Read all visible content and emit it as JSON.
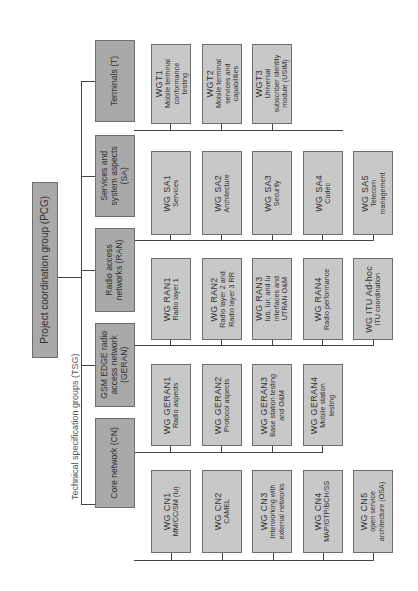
{
  "diagram": {
    "orientation": "rotated 90 degrees counter-clockwise",
    "root": {
      "label": "Project coordination group (PCG)"
    },
    "tsg_caption": "Technical specification groups (TSG)",
    "colors": {
      "root_fill": "#a9a9a9",
      "tsg_fill": "#a9a9a9",
      "wg_fill": "#c8c8c8",
      "line": "#444444",
      "border": "#6e6e6e"
    },
    "tsgs": [
      {
        "label": "Terminals (T)",
        "wgs": [
          {
            "title": "WGT1",
            "desc": [
              "Mobile terminal",
              "conformance",
              "testing"
            ]
          },
          {
            "title": "WGT2",
            "desc": [
              "Mobile terminal",
              "services and",
              "capabilities"
            ]
          },
          {
            "title": "WGT3",
            "desc": [
              "Universal",
              "subscriber identity",
              "module (USIM)"
            ]
          }
        ]
      },
      {
        "label": "Services and system aspects (SA)",
        "label_lines": [
          "Services and",
          "system aspects",
          "(SA)"
        ],
        "wgs": [
          {
            "title": "WG SA1",
            "desc": [
              "Services"
            ]
          },
          {
            "title": "WG SA2",
            "desc": [
              "Architecture"
            ]
          },
          {
            "title": "WG SA3",
            "desc": [
              "Security"
            ]
          },
          {
            "title": "WG SA4",
            "desc": [
              "Codec"
            ]
          },
          {
            "title": "WG SA5",
            "desc": [
              "Telecom",
              "management"
            ]
          }
        ]
      },
      {
        "label": "Radio access networks (RAN)",
        "label_lines": [
          "Radio access",
          "networks (RAN)"
        ],
        "wgs": [
          {
            "title": "WG RAN1",
            "desc": [
              "Radio layer 1"
            ]
          },
          {
            "title": "WG RAN2",
            "desc": [
              "Radio layer 2 and",
              "Radio layer 3 RR"
            ]
          },
          {
            "title": "WG RAN3",
            "desc": [
              "Iub, Iur, and Iu",
              "interfaces and",
              "UTRAN O&M"
            ]
          },
          {
            "title": "WG RAN4",
            "desc": [
              "Radio performance"
            ]
          },
          {
            "title": "WG ITU Ad-hoc",
            "desc": [
              "ITU coordination"
            ]
          }
        ]
      },
      {
        "label": "GSM EDGE radio access network (GERAN)",
        "label_lines": [
          "GSM EDGE radio",
          "access network",
          "(GERAN)"
        ],
        "wgs": [
          {
            "title": "WG GERAN1",
            "desc": [
              "Radio aspects"
            ]
          },
          {
            "title": "WG GERAN2",
            "desc": [
              "Protocol aspects"
            ]
          },
          {
            "title": "WG GERAN3",
            "desc": [
              "Base station testing",
              "and O&M"
            ]
          },
          {
            "title": "WG GERAN4",
            "desc": [
              "Mobile station",
              "testing"
            ]
          }
        ]
      },
      {
        "label": "Core network (CN)",
        "label_lines": [
          "Core network (CN)"
        ],
        "wgs": [
          {
            "title": "WG CN1",
            "desc": [
              "MM/CC/SM (Iu)"
            ]
          },
          {
            "title": "WG CN2",
            "desc": [
              "CAMEL"
            ]
          },
          {
            "title": "WG CN3",
            "desc": [
              "Interworking with",
              "external networks"
            ]
          },
          {
            "title": "WG CN4",
            "desc": [
              "MAP/GTP/BCH/SS"
            ]
          },
          {
            "title": "WG CN5",
            "desc": [
              "open service",
              "architecture (OSA)"
            ]
          }
        ]
      }
    ]
  },
  "labels": {
    "pcg": "Project coordination group (PCG)",
    "caption": "Technical specification groups (TSG)",
    "t": "Terminals (T)",
    "sa_1": "Services and",
    "sa_2": "system aspects",
    "sa_3": "(SA)",
    "ran_1": "Radio access",
    "ran_2": "networks (RAN)",
    "geran_1": "GSM EDGE radio",
    "geran_2": "access network",
    "geran_3": "(GERAN)",
    "cn": "Core network (CN)",
    "wgt1": "WGT1",
    "wgt1_a": "Mobile terminal",
    "wgt1_b": "conformance",
    "wgt1_c": "testing",
    "wgt2": "WGT2",
    "wgt2_a": "Mobile terminal",
    "wgt2_b": "services and",
    "wgt2_c": "capabilities",
    "wgt3": "WGT3",
    "wgt3_a": "Universal",
    "wgt3_b": "subscriber identity",
    "wgt3_c": "module (USIM)",
    "sa1": "WG SA1",
    "sa1_a": "Services",
    "sa2": "WG SA2",
    "sa2_a": "Architecture",
    "sa3": "WG SA3",
    "sa3_a": "Security",
    "sa4": "WG SA4",
    "sa4_a": "Codec",
    "sa5": "WG SA5",
    "sa5_a": "Telecom",
    "sa5_b": "management",
    "ran1": "WG RAN1",
    "ran1_a": "Radio layer 1",
    "ran2": "WG RAN2",
    "ran2_a": "Radio layer 2 and",
    "ran2_b": "Radio layer 3 RR",
    "ran3": "WG RAN3",
    "ran3_a": "Iub, Iur, and Iu",
    "ran3_b": "interfaces and",
    "ran3_c": "UTRAN O&M",
    "ran4": "WG RAN4",
    "ran4_a": "Radio performance",
    "itu": "WG ITU Ad-hoc",
    "itu_a": "ITU coordination",
    "geran1": "WG GERAN1",
    "geran1_a": "Radio aspects",
    "geran2": "WG GERAN2",
    "geran2_a": "Protocol aspects",
    "geran3": "WG GERAN3",
    "geran3_a": "Base station testing",
    "geran3_b": "and O&M",
    "geran4": "WG GERAN4",
    "geran4_a": "Mobile station",
    "geran4_b": "testing",
    "cn1": "WG CN1",
    "cn1_a": "MM/CC/SM (Iu)",
    "cn2": "WG CN2",
    "cn2_a": "CAMEL",
    "cn3": "WG CN3",
    "cn3_a": "Interworking with",
    "cn3_b": "external networks",
    "cn4": "WG CN4",
    "cn4_a": "MAP/GTP/BCH/SS",
    "cn5": "WG CN5",
    "cn5_a": "open service",
    "cn5_b": "architecture (OSA)"
  }
}
